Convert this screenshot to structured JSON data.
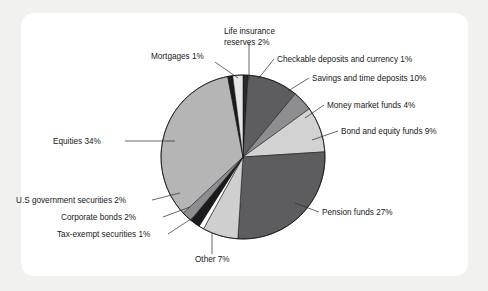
{
  "figure": {
    "background_color": "#f1f1f0",
    "card_color": "#ffffff",
    "label_color": "#17171a",
    "outline_color": "#111114"
  },
  "chart_data": {
    "type": "pie",
    "title": "",
    "subtitle": "",
    "xlabel": "",
    "ylabel": "",
    "legend_position": "none",
    "grid": false,
    "units": "percent",
    "total": 100,
    "start_angle_deg": -90,
    "direction": "clockwise",
    "center": {
      "x": 243,
      "y": 157
    },
    "radius": 82,
    "categories": [
      "Checkable deposits and currency",
      "Savings and time deposits",
      "Money market funds",
      "Bond and equity funds",
      "Pension funds",
      "Other",
      "Tax-exempt securities",
      "Corporate bonds",
      "U.S government securities",
      "Equities",
      "Mortgages",
      "Life insurance reserves"
    ],
    "values": [
      1,
      10,
      4,
      9,
      27,
      7,
      1,
      2,
      2,
      34,
      1,
      2
    ],
    "colors": [
      "#2a2a2d",
      "#5d5d60",
      "#8e8e91",
      "#d2d2d2",
      "#5d5d60",
      "#cfcfcf",
      "#ffffff",
      "#1b1b1e",
      "#8e8e91",
      "#b5b5b5",
      "#1b1b1e",
      "#e6e6e6"
    ],
    "slices": [
      {
        "label": "Checkable deposits and currency",
        "value": 1,
        "label_text": "Checkable deposits and currency  1%",
        "color": "#2a2a2d"
      },
      {
        "label": "Savings and time deposits",
        "value": 10,
        "label_text": "Savings and time deposits  10%",
        "color": "#5d5d60"
      },
      {
        "label": "Money market funds",
        "value": 4,
        "label_text": "Money market funds 4%",
        "color": "#8e8e91"
      },
      {
        "label": "Bond and equity funds",
        "value": 9,
        "label_text": "Bond and equity funds 9%",
        "color": "#d2d2d2"
      },
      {
        "label": "Pension funds",
        "value": 27,
        "label_text": "Pension funds 27%",
        "color": "#5d5d60"
      },
      {
        "label": "Other",
        "value": 7,
        "label_text": "Other 7%",
        "color": "#cfcfcf"
      },
      {
        "label": "Tax-exempt securities",
        "value": 1,
        "label_text": "Tax-exempt securities 1%",
        "color": "#ffffff"
      },
      {
        "label": "Corporate bonds",
        "value": 2,
        "label_text": "Corporate bonds 2%",
        "color": "#1b1b1e"
      },
      {
        "label": "U.S government securities",
        "value": 2,
        "label_text": "U.S government securities 2%",
        "color": "#8e8e91"
      },
      {
        "label": "Equities",
        "value": 34,
        "label_text": "Equities 34%",
        "color": "#b5b5b5"
      },
      {
        "label": "Mortgages",
        "value": 1,
        "label_text": "Mortgages 1%",
        "color": "#1b1b1e"
      },
      {
        "label": "Life insurance reserves",
        "value": 2,
        "label_text": "Life insurance reserves 2%",
        "color": "#e6e6e6"
      }
    ],
    "annotations": [
      {
        "name": "life-insurance-reserves",
        "lines": [
          "Life insurance",
          "reserves 2%"
        ],
        "x": 224,
        "y": 34,
        "anchor": "start",
        "leader": [
          [
            249,
            42
          ],
          [
            249,
            80
          ]
        ]
      },
      {
        "name": "checkable-deposits-and-currency",
        "lines": [
          "Checkable deposits and currency  1%"
        ],
        "x": 277,
        "y": 62,
        "anchor": "start",
        "leader": [
          [
            274,
            59
          ],
          [
            258,
            79
          ]
        ]
      },
      {
        "name": "mortgages",
        "lines": [
          "Mortgages 1%"
        ],
        "x": 151,
        "y": 59,
        "anchor": "start",
        "leader": [
          [
            215,
            62
          ],
          [
            238,
            78
          ]
        ]
      },
      {
        "name": "savings-and-time-deposits",
        "lines": [
          "Savings and time deposits  10%"
        ],
        "x": 312,
        "y": 81,
        "anchor": "start",
        "leader": [
          [
            309,
            78
          ],
          [
            288,
            91
          ]
        ]
      },
      {
        "name": "money-market-funds",
        "lines": [
          "Money market funds 4%"
        ],
        "x": 327,
        "y": 108,
        "anchor": "start",
        "leader": [
          [
            324,
            105
          ],
          [
            305,
            118
          ]
        ]
      },
      {
        "name": "bond-and-equity-funds",
        "lines": [
          "Bond and equity funds 9%"
        ],
        "x": 341,
        "y": 134,
        "anchor": "start",
        "leader": [
          [
            338,
            131
          ],
          [
            312,
            140
          ]
        ]
      },
      {
        "name": "pension-funds",
        "lines": [
          "Pension funds 27%"
        ],
        "x": 322,
        "y": 215,
        "anchor": "start",
        "leader": [
          [
            319,
            212
          ],
          [
            295,
            203
          ]
        ]
      },
      {
        "name": "equities",
        "lines": [
          "Equities 34%"
        ],
        "x": 53,
        "y": 144,
        "anchor": "start",
        "leader": [
          [
            125,
            141
          ],
          [
            175,
            141
          ]
        ]
      },
      {
        "name": "us-government-securities",
        "lines": [
          "U.S government securities 2%"
        ],
        "x": 16,
        "y": 203,
        "anchor": "start",
        "leader": [
          [
            152,
            200
          ],
          [
            180,
            193
          ]
        ]
      },
      {
        "name": "corporate-bonds",
        "lines": [
          "Corporate bonds 2%"
        ],
        "x": 61,
        "y": 220,
        "anchor": "start",
        "leader": [
          [
            163,
            217
          ],
          [
            190,
            207
          ]
        ]
      },
      {
        "name": "tax-exempt-securities",
        "lines": [
          "Tax-exempt securities 1%"
        ],
        "x": 57,
        "y": 237,
        "anchor": "start",
        "leader": [
          [
            168,
            234
          ],
          [
            197,
            215
          ]
        ]
      },
      {
        "name": "other",
        "lines": [
          "Other 7%"
        ],
        "x": 195,
        "y": 262,
        "anchor": "start",
        "leader": [
          [
            212,
            254
          ],
          [
            212,
            233
          ]
        ]
      }
    ]
  }
}
